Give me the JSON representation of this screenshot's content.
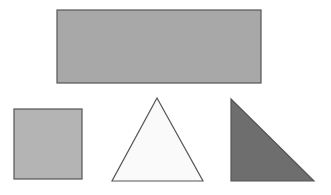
{
  "canvas": {
    "width": 331,
    "height": 195,
    "background_color": "#FFFFFF",
    "title": "Geometric shapes figure"
  },
  "style": {
    "stroke_color": "#555555",
    "stroke_width": 1.2,
    "rectangle_fill": "#A8A8A8",
    "square_fill": "#B4B4B4",
    "triangle_fill": "#FAFAFA",
    "right_triangle_fill": "#6E6E6E"
  },
  "shapes": [
    {
      "id": "large-rectangle",
      "type": "rectangle",
      "label": "Large gray rectangle",
      "fill": "#A8A8A8",
      "stroke": "#555555",
      "x": 57,
      "y": 10,
      "width": 204,
      "height": 73
    },
    {
      "id": "small-square",
      "type": "square",
      "label": "Small light gray square",
      "fill": "#B4B4B4",
      "stroke": "#555555",
      "x": 14,
      "y": 109,
      "width": 68,
      "height": 70
    },
    {
      "id": "equilateral-triangle",
      "type": "triangle",
      "label": "White equilateral triangle",
      "fill": "#FAFAFA",
      "stroke": "#555555",
      "points": "157,98 203,181 112,181"
    },
    {
      "id": "right-triangle",
      "type": "right-triangle",
      "label": "Dark gray right triangle",
      "fill": "#6E6E6E",
      "stroke": "#555555",
      "points": "231,99 314,181 231,181"
    }
  ]
}
